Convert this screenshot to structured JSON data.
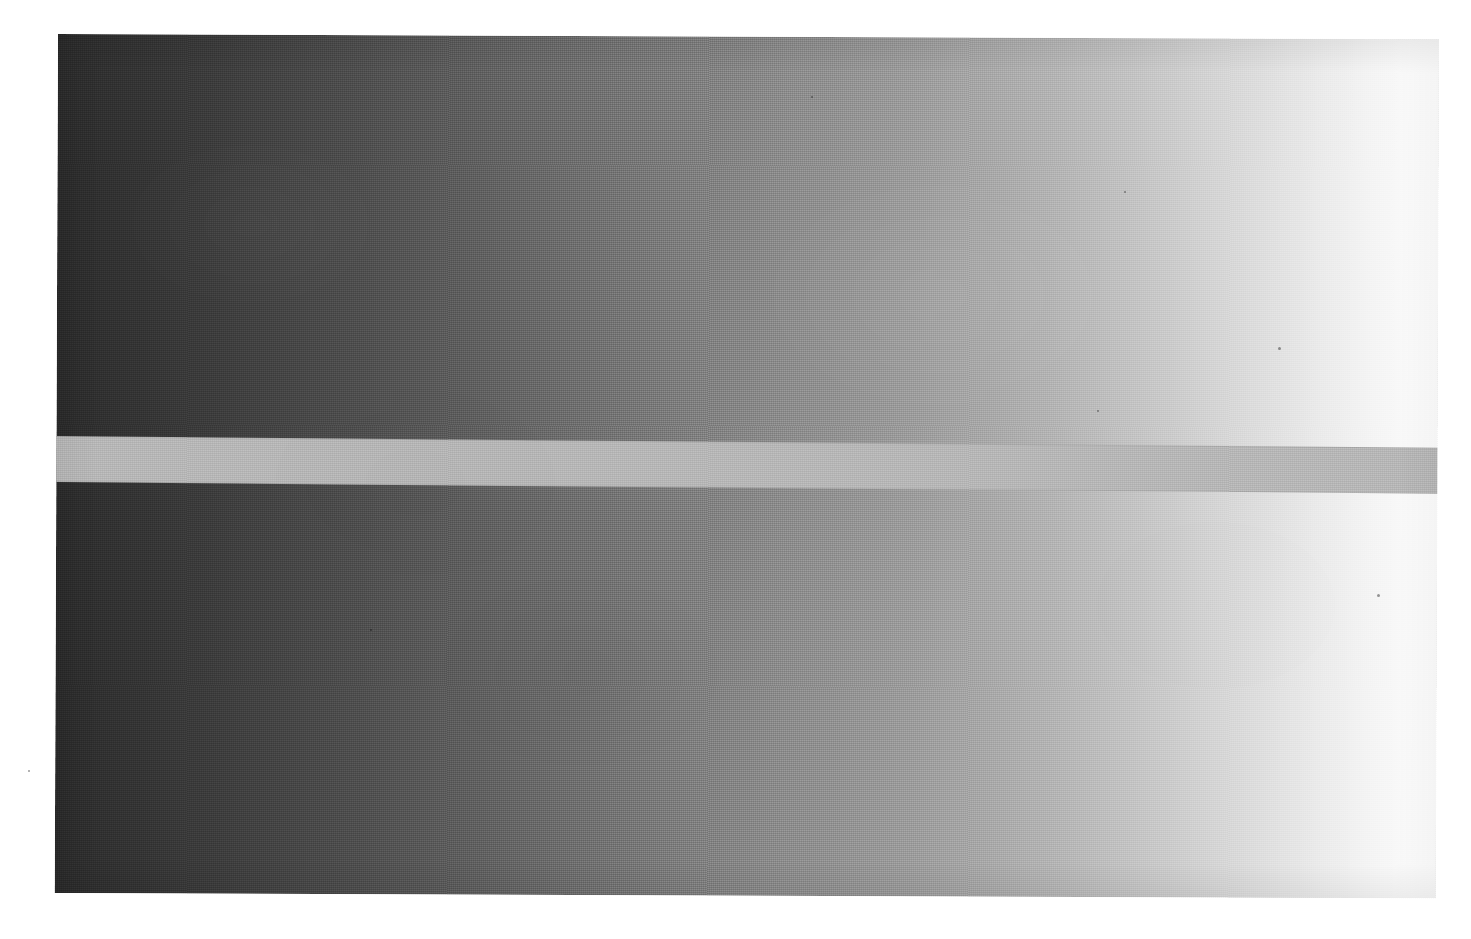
{
  "page": {
    "width": 1471,
    "height": 939,
    "background_color": "#ffffff",
    "content_type": "scanned-photograph"
  },
  "scan_region": {
    "name": "photographed-print",
    "left": 58,
    "top": 34,
    "width": 1381,
    "height": 859,
    "rotation_degrees": 0.22,
    "texture": "fine-woven-halftone-scan-grain"
  },
  "gradient_field": {
    "name": "horizontal-luminance-ramp",
    "direction": "left-to-right",
    "start_color": "#2c2c2c",
    "mid_color": "#8d8d8d",
    "end_color": "#fcfcfc",
    "description": "smooth dark-to-light grayscale ramp spanning the full print width"
  },
  "constant_band": {
    "name": "constant-luminance-strip",
    "color": "#b8b8b8",
    "top_fraction": 0.468,
    "height_fraction": 0.0535,
    "rotation_degrees": 0.26,
    "crossover_x": 930,
    "appearance_left": "lighter-than-background",
    "appearance_right": "darker-than-background",
    "description": "uniform mid-gray bar of fixed reflectance crossing the full width; appears to change brightness only because the surround changes"
  },
  "specks": [
    {
      "left": 1278,
      "top": 347,
      "size": 3
    },
    {
      "left": 1377,
      "top": 594,
      "size": 3
    },
    {
      "left": 1097,
      "top": 410,
      "size": 2
    },
    {
      "left": 370,
      "top": 629,
      "size": 2
    },
    {
      "left": 1124,
      "top": 191,
      "size": 2
    },
    {
      "left": 811,
      "top": 96,
      "size": 2
    },
    {
      "left": 28,
      "top": 770,
      "size": 2
    }
  ]
}
